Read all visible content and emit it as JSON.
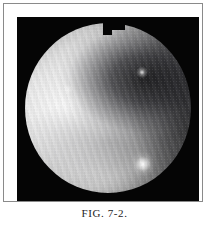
{
  "figure": {
    "caption": "FIG. 7-2.",
    "frame": {
      "border_color": "#8a8a8a",
      "mat_color": "#ffffff"
    },
    "photograph": {
      "kind": "endoscopic-photograph",
      "background_color": "#050505",
      "field_of_view_shape": "circle",
      "notch": "rectangular step notch at top rim, right of centre"
    },
    "regions": [
      {
        "name": "bright-mucosal-mass-left",
        "description": "broad smooth highly illuminated tissue filling the left half",
        "tone": "#ececec"
      },
      {
        "name": "dark-recess-upper-right",
        "description": "shadowed cavity / recess occupying the upper right quadrant",
        "tone": "#232326"
      },
      {
        "name": "fold-shadow-lower-centre",
        "description": "soft shadow along a tissue fold crossing the lower centre",
        "tone": "#606064"
      },
      {
        "name": "specular-highlight-lower-right",
        "description": "bright specular reflection of the light source near the lower right",
        "tone": "#ffffff"
      },
      {
        "name": "specular-point-upper-right",
        "description": "small bright point within the dark recess",
        "tone": "#ffffff"
      }
    ]
  }
}
